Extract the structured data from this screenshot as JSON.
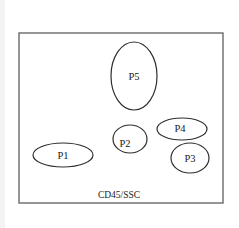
{
  "diagram": {
    "frame": {
      "x": 19,
      "y": 33,
      "width": 204,
      "height": 170
    },
    "axis_label": "CD45/SSC",
    "gates": [
      {
        "id": "P1",
        "label": "P1",
        "cx": 63,
        "cy": 155,
        "rx": 30,
        "ry": 12
      },
      {
        "id": "P2",
        "label": "P2",
        "cx": 130,
        "cy": 139,
        "rx": 17,
        "ry": 14
      },
      {
        "id": "P3",
        "label": "P3",
        "cx": 190,
        "cy": 158,
        "rx": 19,
        "ry": 15
      },
      {
        "id": "P4",
        "label": "P4",
        "cx": 182,
        "cy": 129,
        "rx": 25,
        "ry": 11
      },
      {
        "id": "P5",
        "label": "P5",
        "cx": 134,
        "cy": 76,
        "rx": 23,
        "ry": 34
      }
    ]
  }
}
